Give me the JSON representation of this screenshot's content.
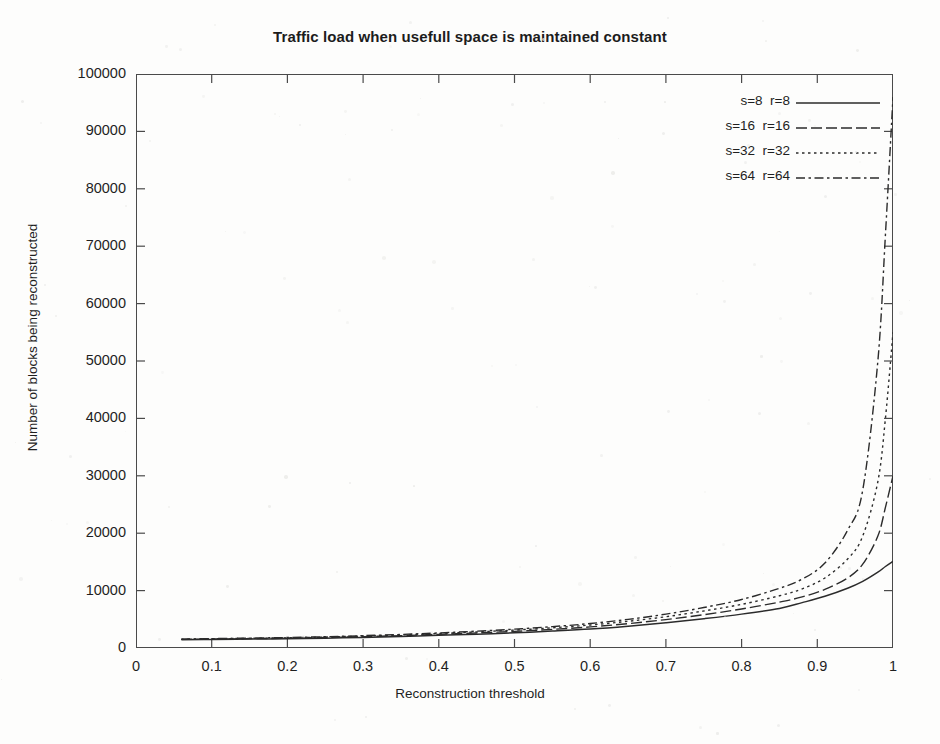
{
  "chart_data": {
    "type": "line",
    "title": "Traffic load when usefull space is maintained constant",
    "xlabel": "Reconstruction threshold",
    "ylabel": "Number of blocks being reconstructed",
    "xlim": [
      0,
      1
    ],
    "ylim": [
      0,
      100000
    ],
    "grid": false,
    "legend_position": "top-right",
    "xticks": [
      "0",
      "0.1",
      "0.2",
      "0.3",
      "0.4",
      "0.5",
      "0.6",
      "0.7",
      "0.8",
      "0.9",
      "1"
    ],
    "xtick_values": [
      0,
      0.1,
      0.2,
      0.3,
      0.4,
      0.5,
      0.6,
      0.7,
      0.8,
      0.9,
      1
    ],
    "yticks": [
      "0",
      "10000",
      "20000",
      "30000",
      "40000",
      "50000",
      "60000",
      "70000",
      "80000",
      "90000",
      "100000"
    ],
    "ytick_values": [
      0,
      10000,
      20000,
      30000,
      40000,
      50000,
      60000,
      70000,
      80000,
      90000,
      100000
    ],
    "series": [
      {
        "name": "s=8  r=8",
        "style": "solid",
        "x": [
          0.06,
          0.1,
          0.15,
          0.2,
          0.25,
          0.3,
          0.35,
          0.4,
          0.45,
          0.5,
          0.55,
          0.6,
          0.65,
          0.7,
          0.75,
          0.8,
          0.85,
          0.88,
          0.91,
          0.94,
          0.96,
          0.98,
          0.99,
          1.0
        ],
        "values": [
          1450,
          1500,
          1550,
          1600,
          1700,
          1850,
          2000,
          2200,
          2400,
          2650,
          2950,
          3300,
          3800,
          4400,
          5100,
          5900,
          6900,
          7900,
          9000,
          10400,
          11600,
          13200,
          14200,
          15100
        ]
      },
      {
        "name": "s=16  r=16",
        "style": "longdash",
        "x": [
          0.06,
          0.1,
          0.15,
          0.2,
          0.25,
          0.3,
          0.35,
          0.4,
          0.45,
          0.5,
          0.55,
          0.6,
          0.65,
          0.7,
          0.75,
          0.8,
          0.85,
          0.88,
          0.91,
          0.94,
          0.96,
          0.98,
          0.99,
          1.0
        ],
        "values": [
          1500,
          1560,
          1620,
          1700,
          1820,
          1980,
          2150,
          2380,
          2620,
          2900,
          3250,
          3680,
          4250,
          4950,
          5800,
          6800,
          8000,
          8900,
          10200,
          12200,
          14600,
          19500,
          24500,
          30000
        ]
      },
      {
        "name": "s=32  r=32",
        "style": "dotted",
        "x": [
          0.06,
          0.1,
          0.15,
          0.2,
          0.25,
          0.3,
          0.35,
          0.4,
          0.45,
          0.5,
          0.55,
          0.6,
          0.65,
          0.7,
          0.75,
          0.8,
          0.85,
          0.88,
          0.91,
          0.94,
          0.96,
          0.98,
          0.99,
          1.0
        ],
        "values": [
          1520,
          1600,
          1680,
          1780,
          1900,
          2080,
          2280,
          2520,
          2800,
          3120,
          3520,
          4000,
          4650,
          5450,
          6450,
          7600,
          9100,
          10300,
          12200,
          15500,
          19500,
          29000,
          40000,
          55000
        ]
      },
      {
        "name": "s=64  r=64",
        "style": "dashdot",
        "x": [
          0.06,
          0.1,
          0.15,
          0.2,
          0.25,
          0.3,
          0.35,
          0.4,
          0.45,
          0.5,
          0.55,
          0.6,
          0.65,
          0.7,
          0.75,
          0.8,
          0.85,
          0.88,
          0.91,
          0.94,
          0.96,
          0.98,
          0.99,
          1.0
        ],
        "values": [
          1540,
          1630,
          1720,
          1830,
          1960,
          2150,
          2360,
          2620,
          2930,
          3280,
          3720,
          4260,
          4980,
          5900,
          7050,
          8450,
          10400,
          12000,
          14800,
          20500,
          27500,
          50000,
          72000,
          96000
        ]
      }
    ]
  },
  "legend": {
    "items": [
      {
        "label": "s=8  r=8",
        "style": "solid"
      },
      {
        "label": "s=16  r=16",
        "style": "longdash"
      },
      {
        "label": "s=32  r=32",
        "style": "dotted"
      },
      {
        "label": "s=64  r=64",
        "style": "dashdot"
      }
    ]
  },
  "colors": {
    "line": "#2b2b2b",
    "axis": "#4a4a4a",
    "text": "#1f1f1f",
    "background": "#fdfdfc"
  }
}
